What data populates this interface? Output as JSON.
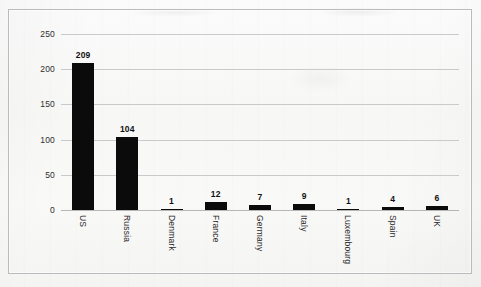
{
  "chart_data": {
    "type": "bar",
    "title": "",
    "subtitle": "",
    "xlabel": "",
    "ylabel": "",
    "categories": [
      "US",
      "Russia",
      "Denmark",
      "France",
      "Germany",
      "Italy",
      "Luxembourg",
      "Spain",
      "UK"
    ],
    "values": [
      209,
      104,
      1,
      12,
      7,
      9,
      1,
      4,
      6
    ],
    "value_labels": [
      "209",
      "104",
      "1",
      "12",
      "7",
      "9",
      "1",
      "4",
      "6"
    ],
    "ylim": [
      0,
      250
    ],
    "yticks": [
      0,
      50,
      100,
      150,
      200,
      250
    ],
    "ytick_labels": [
      "0",
      "50",
      "100",
      "150",
      "200",
      "250"
    ],
    "grid": true,
    "legend": false,
    "legend_position": "none",
    "orientation": "vertical",
    "bar_color": "#0b0b0b",
    "gridline_color": "#c9cacc",
    "data_labels_shown": true,
    "data_label_style": "bold-above-bar",
    "category_label_rotation": 90
  },
  "frame": {
    "border_color": "#b9bbbd",
    "background_color": "#f8f8f7"
  }
}
